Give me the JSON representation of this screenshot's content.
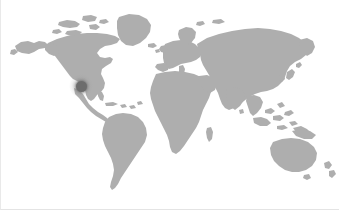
{
  "widget": {
    "name": "world-map-location-widget",
    "title": "World Map",
    "width": 339,
    "height": 210,
    "background_color": "#ffffff",
    "land_color": "#aeaeae",
    "border_color": "#e9e9e9"
  },
  "map": {
    "projection": "equirectangular",
    "land_label": "World landmasses",
    "ocean_label": "Ocean",
    "continents": [
      "North America",
      "South America",
      "Europe",
      "Africa",
      "Asia",
      "Australia",
      "Greenland",
      "Antarctica-omitted"
    ]
  },
  "marker": {
    "name": "location-marker",
    "label": "",
    "region": "South-Central United States",
    "x": 80,
    "y": 86,
    "core_color": "#6d6d6d",
    "glow_color": "#8a8a8a",
    "core_radius": 5.5,
    "glow_radius": 12
  },
  "legend": {
    "visible": false,
    "items": []
  }
}
